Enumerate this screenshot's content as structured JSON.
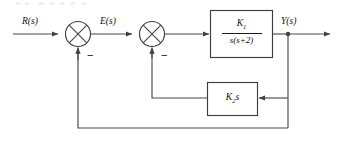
{
  "diagram": {
    "line_color": "#4a4a4a",
    "text_color": "#111111",
    "background": "#ffffff",
    "signals": {
      "input_label": "R(s)",
      "error_label": "E(s)",
      "output_label": "Y(s)"
    },
    "summing_junctions": [
      {
        "name": "summing-junction-1",
        "sign_input": "+",
        "sign_feedback": "−",
        "minus_label": "−"
      },
      {
        "name": "summing-junction-2",
        "sign_input": "+",
        "sign_feedback": "−",
        "minus_label": "−"
      }
    ],
    "blocks": [
      {
        "name": "plant-block",
        "numerator": "K",
        "numerator_sub": "1",
        "denominator": "s(s+2)",
        "transfer_function": "K1/(s(s+2))"
      },
      {
        "name": "rate-feedback-block",
        "gain": "K",
        "gain_sub": "2",
        "gain_suffix": "s",
        "transfer_function": "K2 s"
      }
    ],
    "paths": [
      {
        "name": "forward-path",
        "from": "R(s)",
        "to": "Y(s)"
      },
      {
        "name": "inner-feedback-path",
        "from": "Y(s)",
        "to": "summing-junction-2",
        "through": "rate-feedback-block"
      },
      {
        "name": "outer-feedback-path",
        "from": "Y(s)",
        "to": "summing-junction-1",
        "through": "unity"
      }
    ]
  }
}
